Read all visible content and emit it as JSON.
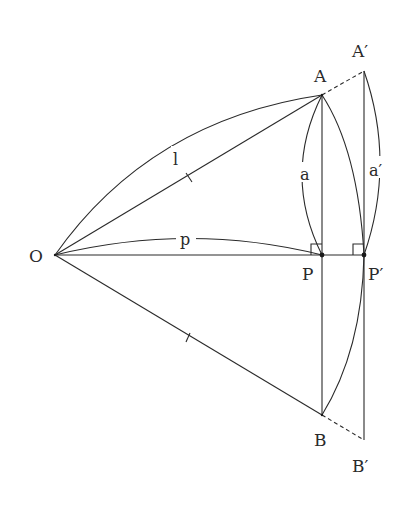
{
  "diagram": {
    "points": {
      "O": {
        "label": "O",
        "x": 55,
        "y": 255
      },
      "A": {
        "label": "A",
        "x": 322,
        "y": 95
      },
      "A_prime": {
        "label": "A′",
        "x": 364,
        "y": 71
      },
      "P": {
        "label": "P",
        "x": 322,
        "y": 255
      },
      "P_prime": {
        "label": "P′",
        "x": 364,
        "y": 255
      },
      "B": {
        "label": "B",
        "x": 322,
        "y": 415
      },
      "B_prime": {
        "label": "B′",
        "x": 364,
        "y": 440
      }
    },
    "arc_labels": {
      "l": "l",
      "p": "p",
      "a": "a",
      "a_prime": "a′"
    },
    "colors": {
      "stroke": "#2a2a2a",
      "background": "#ffffff"
    }
  }
}
